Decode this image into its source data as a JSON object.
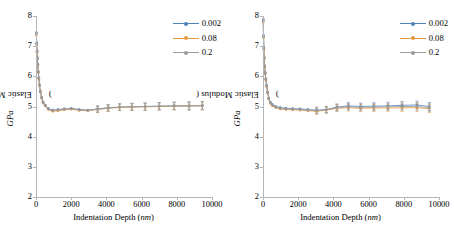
{
  "figure": {
    "panels": [
      {
        "name": "left-panel",
        "ylabel_text": "Elastic Modulus (",
        "ylabel_unit": "GPa",
        "ylabel_close": ")",
        "xlabel_text": "Indentation Depth (",
        "xlabel_unit": "nm",
        "xlabel_close": ")"
      },
      {
        "name": "right-panel",
        "ylabel_text": "Elastic Modulus (",
        "ylabel_unit": "GPa",
        "ylabel_close": ")",
        "xlabel_text": "Indentation Depth (",
        "xlabel_unit": "nm",
        "xlabel_close": ")"
      }
    ],
    "legend": {
      "items": [
        {
          "label": "0.002",
          "color": "#4f81bd"
        },
        {
          "label": "0.08",
          "color": "#e8983f"
        },
        {
          "label": "0.2",
          "color": "#9b9b9b"
        }
      ]
    },
    "colors": {
      "series_1": "#4f81bd",
      "series_2": "#e8983f",
      "series_3": "#9b9b9b",
      "axis": "#b6b6b6",
      "background": "#ffffff"
    }
  },
  "chart_data": [
    {
      "type": "line",
      "title": "",
      "panel": "left",
      "xlabel": "Indentation Depth (nm)",
      "ylabel": "Elastic Modulus (GPa)",
      "xlim": [
        0,
        10000
      ],
      "ylim": [
        2,
        8
      ],
      "xticks": [
        0,
        2000,
        4000,
        6000,
        8000,
        10000
      ],
      "yticks": [
        2,
        3,
        4,
        5,
        6,
        7,
        8
      ],
      "grid": false,
      "legend_position": "top-right",
      "series": [
        {
          "name": "0.002",
          "color": "#4f81bd",
          "x": [
            20,
            40,
            60,
            80,
            100,
            130,
            160,
            200,
            250,
            320,
            400,
            520,
            700,
            950,
            1250,
            1600,
            2000,
            2450,
            2950,
            3500,
            4100,
            4750,
            5450,
            6200,
            7000,
            7850,
            8700,
            9450
          ],
          "y": [
            7.45,
            7.1,
            6.85,
            6.62,
            6.4,
            6.15,
            5.95,
            5.72,
            5.5,
            5.3,
            5.15,
            5.05,
            4.93,
            4.88,
            4.9,
            4.92,
            4.94,
            4.9,
            4.88,
            4.92,
            4.96,
            4.98,
            4.99,
            5.0,
            5.01,
            5.02,
            5.02,
            5.03
          ]
        },
        {
          "name": "0.08",
          "color": "#e8983f",
          "x": [
            20,
            40,
            60,
            80,
            100,
            130,
            160,
            200,
            250,
            320,
            400,
            520,
            700,
            950,
            1250,
            1600,
            2000,
            2450,
            2950,
            3500,
            4100,
            4750,
            5450,
            6200,
            7000,
            7850,
            8700,
            9450
          ],
          "y": [
            7.38,
            7.05,
            6.8,
            6.58,
            6.36,
            6.12,
            5.92,
            5.7,
            5.48,
            5.28,
            5.12,
            5.02,
            4.9,
            4.84,
            4.86,
            4.89,
            4.91,
            4.87,
            4.86,
            4.9,
            4.94,
            4.97,
            4.98,
            4.99,
            5.0,
            5.01,
            5.02,
            5.02
          ]
        },
        {
          "name": "0.2",
          "color": "#9b9b9b",
          "x": [
            20,
            40,
            60,
            80,
            100,
            130,
            160,
            200,
            250,
            320,
            400,
            520,
            700,
            950,
            1250,
            1600,
            2000,
            2450,
            2950,
            3500,
            4100,
            4750,
            5450,
            6200,
            7000,
            7850,
            8700,
            9450
          ],
          "y": [
            7.42,
            7.08,
            6.83,
            6.6,
            6.38,
            6.14,
            5.94,
            5.71,
            5.49,
            5.29,
            5.14,
            5.04,
            4.92,
            4.87,
            4.89,
            4.91,
            4.93,
            4.89,
            4.87,
            4.91,
            4.95,
            4.98,
            4.99,
            5.0,
            5.01,
            5.02,
            5.02,
            5.03
          ]
        }
      ]
    },
    {
      "type": "line",
      "title": "",
      "panel": "right",
      "xlabel": "Indentation Depth (nm)",
      "ylabel": "Elastic Modulus (GPa)",
      "xlim": [
        0,
        10000
      ],
      "ylim": [
        2,
        8
      ],
      "xticks": [
        0,
        2000,
        4000,
        6000,
        8000,
        10000
      ],
      "yticks": [
        2,
        3,
        4,
        5,
        6,
        7,
        8
      ],
      "grid": false,
      "legend_position": "top-right",
      "series": [
        {
          "name": "0.002",
          "color": "#4f81bd",
          "x": [
            15,
            30,
            50,
            70,
            95,
            125,
            160,
            205,
            260,
            330,
            420,
            550,
            730,
            980,
            1300,
            1680,
            2100,
            2550,
            3050,
            3600,
            4200,
            4850,
            5550,
            6300,
            7100,
            7900,
            8750,
            9450
          ],
          "y": [
            7.88,
            7.35,
            6.95,
            6.62,
            6.35,
            6.12,
            5.92,
            5.7,
            5.48,
            5.28,
            5.14,
            5.06,
            5.0,
            4.96,
            4.94,
            4.93,
            4.92,
            4.9,
            4.88,
            4.9,
            4.98,
            5.02,
            5.0,
            5.01,
            5.02,
            5.04,
            5.05,
            5.0
          ]
        },
        {
          "name": "0.08",
          "color": "#e8983f",
          "x": [
            15,
            30,
            50,
            70,
            95,
            125,
            160,
            205,
            260,
            330,
            420,
            550,
            730,
            980,
            1300,
            1680,
            2100,
            2550,
            3050,
            3600,
            4200,
            4850,
            5550,
            6300,
            7100,
            7900,
            8750,
            9450
          ],
          "y": [
            7.8,
            7.28,
            6.9,
            6.58,
            6.3,
            6.08,
            5.88,
            5.66,
            5.45,
            5.25,
            5.1,
            5.02,
            4.96,
            4.92,
            4.9,
            4.89,
            4.88,
            4.86,
            4.84,
            4.88,
            4.94,
            4.96,
            4.94,
            4.95,
            4.95,
            4.96,
            4.96,
            4.93
          ]
        },
        {
          "name": "0.2",
          "color": "#9b9b9b",
          "x": [
            15,
            30,
            50,
            70,
            95,
            125,
            160,
            205,
            260,
            330,
            420,
            550,
            730,
            980,
            1300,
            1680,
            2100,
            2550,
            3050,
            3600,
            4200,
            4850,
            5550,
            6300,
            7100,
            7900,
            8750,
            9450
          ],
          "y": [
            7.84,
            7.32,
            6.92,
            6.6,
            6.32,
            6.1,
            5.9,
            5.68,
            5.46,
            5.26,
            5.12,
            5.04,
            4.98,
            4.94,
            4.92,
            4.91,
            4.9,
            4.88,
            4.86,
            4.89,
            4.96,
            4.99,
            4.97,
            4.98,
            4.99,
            5.0,
            5.0,
            4.96
          ]
        }
      ]
    }
  ]
}
